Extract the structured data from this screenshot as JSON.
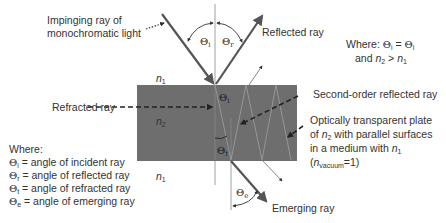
{
  "diagram": {
    "type": "optics-plate-refraction",
    "colors": {
      "plate": "#6e6e6e",
      "ray": "#555555",
      "text": "#333333",
      "normal": "#888888",
      "background": "#ffffff"
    },
    "labels": {
      "impinging_line1": "Impinging ray of",
      "impinging_line2": "monochromatic light",
      "reflected": "Reflected ray",
      "refracted": "Refracted ray",
      "second_order": "Second-order reflected ray",
      "emerging": "Emerging ray",
      "plate_line1": "Optically transparent plate",
      "plate_line2_pre": "of ",
      "plate_line2_n": "n",
      "plate_line2_sub": "2",
      "plate_line2_post": " with parallel surfaces",
      "plate_line3_pre": "in a medium with ",
      "plate_line3_n": "n",
      "plate_line3_sub": "1",
      "plate_line4_open": "(",
      "plate_line4_n": "n",
      "plate_line4_sub": "vacuum",
      "plate_line4_post": "=1)"
    },
    "condition": {
      "line1_prefix": "Where: ",
      "theta": "Θ",
      "sub_i": "i",
      "equals": " = ",
      "line2_prefix": "and ",
      "n": "n",
      "sub_2": "2",
      "gt": " > ",
      "sub_1": "1"
    },
    "media": {
      "n1_top": "n",
      "n1_sub": "1",
      "n2": "n",
      "n2_sub": "2",
      "n1_bottom": "n",
      "n1_bottom_sub": "1"
    },
    "angles": {
      "theta": "Θ",
      "incident_sub": "i",
      "reflected_sub": "r",
      "refracted_inside_sub": "i",
      "refracted_sub": "t",
      "emerging_sub": "e"
    },
    "legend": {
      "title": "Where:",
      "items": [
        {
          "symbol": "Θ",
          "sub": "i",
          "text": " = angle of incident ray"
        },
        {
          "symbol": "Θ",
          "sub": "r",
          "text": " = angle of reflected ray"
        },
        {
          "symbol": "Θ",
          "sub": "t",
          "text": " = angle of refracted ray"
        },
        {
          "symbol": "Θ",
          "sub": "e",
          "text": " = angle of emerging ray"
        }
      ]
    }
  }
}
